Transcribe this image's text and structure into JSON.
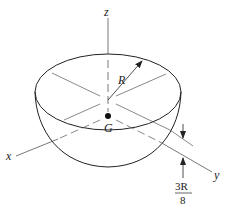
{
  "figure": {
    "labels": {
      "z_axis": "z",
      "x_axis": "x",
      "y_axis": "y",
      "radius": "R",
      "centroid": "G",
      "distance_numerator": "3R",
      "distance_denominator": "8"
    },
    "colors": {
      "stroke": "#222222",
      "axis": "#555555",
      "background": "#ffffff"
    }
  }
}
